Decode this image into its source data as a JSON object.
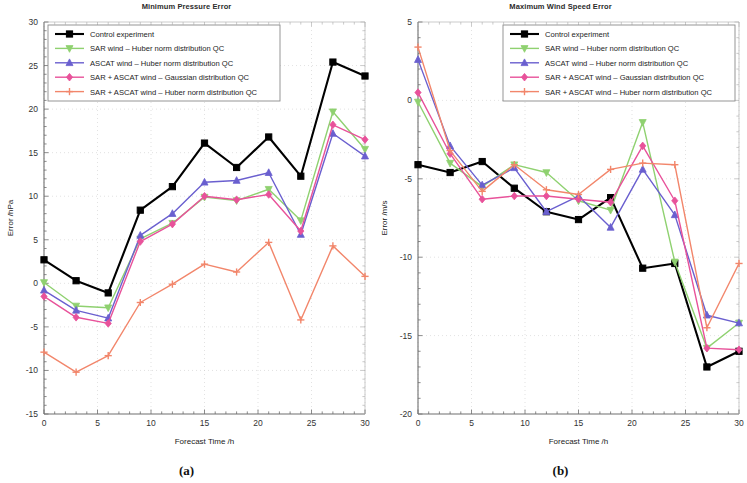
{
  "figure": {
    "panels": [
      {
        "caption": "(a)",
        "title": "Minimum Pressure Error",
        "xlabel": "Forecast Time /h",
        "ylabel": "Error /hPa"
      },
      {
        "caption": "(b)",
        "title": "Maximum Wind Speed Error",
        "xlabel": "Forecast Time /h",
        "ylabel": "Error /m/s"
      }
    ]
  },
  "series_style": {
    "control": {
      "color": "#000000",
      "marker": "square",
      "label": "Control experiment"
    },
    "sar": {
      "color": "#8fd170",
      "marker": "triangle-down",
      "label": "SAR wind – Huber norm distribution QC"
    },
    "ascat": {
      "color": "#6a5fcf",
      "marker": "triangle-up",
      "label": "ASCAT wind – Huber norm distribution QC"
    },
    "sar_ascat_gauss": {
      "color": "#e8529a",
      "marker": "diamond",
      "label": "SAR + ASCAT wind – Gaussian distribution QC"
    },
    "sar_ascat_huber": {
      "color": "#f2866b",
      "marker": "plus",
      "label": "SAR + ASCAT wind – Huber norm distribution QC"
    }
  },
  "chart_data": [
    {
      "type": "line",
      "title": "Minimum Pressure Error",
      "xlabel": "Forecast Time /h",
      "ylabel": "Error /hPa",
      "xlim": [
        0,
        30
      ],
      "ylim": [
        -15,
        30
      ],
      "xticks": [
        0,
        5,
        10,
        15,
        20,
        25,
        30
      ],
      "yticks": [
        -15,
        -10,
        -5,
        0,
        5,
        10,
        15,
        20,
        25,
        30
      ],
      "grid": true,
      "legend_position": "upper left",
      "x": [
        0,
        3,
        6,
        9,
        12,
        15,
        18,
        21,
        24,
        27,
        30
      ],
      "series": [
        {
          "name": "Control experiment",
          "values": [
            2.7,
            0.3,
            -1.1,
            8.4,
            11.1,
            16.1,
            13.3,
            16.8,
            12.3,
            25.4,
            23.8
          ]
        },
        {
          "name": "SAR wind – Huber norm distribution QC",
          "values": [
            0.1,
            -2.6,
            -2.8,
            5.1,
            6.9,
            9.9,
            9.5,
            10.8,
            7.2,
            19.7,
            15.4
          ]
        },
        {
          "name": "ASCAT wind – Huber norm distribution QC",
          "values": [
            -0.8,
            -3.1,
            -4.0,
            5.5,
            8.0,
            11.6,
            11.8,
            12.7,
            5.6,
            17.2,
            14.6
          ]
        },
        {
          "name": "SAR + ASCAT wind – Gaussian distribution QC",
          "values": [
            -1.5,
            -3.9,
            -4.6,
            4.8,
            6.8,
            10.0,
            9.6,
            10.2,
            6.0,
            18.2,
            16.5
          ]
        },
        {
          "name": "SAR + ASCAT wind – Huber norm distribution QC",
          "values": [
            -7.9,
            -10.2,
            -8.3,
            -2.2,
            -0.1,
            2.2,
            1.3,
            4.7,
            -4.2,
            4.3,
            0.8
          ]
        }
      ]
    },
    {
      "type": "line",
      "title": "Maximum Wind Speed Error",
      "xlabel": "Forecast Time /h",
      "ylabel": "Error /m/s",
      "xlim": [
        0,
        30
      ],
      "ylim": [
        -20,
        5
      ],
      "xticks": [
        0,
        5,
        10,
        15,
        20,
        25,
        30
      ],
      "yticks": [
        -20,
        -15,
        -10,
        -5,
        0,
        5
      ],
      "grid": true,
      "legend_position": "upper right",
      "x": [
        0,
        3,
        6,
        9,
        12,
        15,
        18,
        21,
        24,
        27,
        30
      ],
      "series": [
        {
          "name": "Control experiment",
          "values": [
            -4.1,
            -4.6,
            -3.9,
            -5.6,
            -7.1,
            -7.6,
            -6.2,
            -10.7,
            -10.4,
            -17.0,
            -16.0
          ]
        },
        {
          "name": "SAR wind – Huber norm distribution QC",
          "values": [
            -0.1,
            -4.0,
            -5.5,
            -4.1,
            -4.6,
            -6.4,
            -7.0,
            -1.4,
            -10.3,
            -15.8,
            -14.2
          ]
        },
        {
          "name": "ASCAT wind – Huber norm distribution QC",
          "values": [
            2.6,
            -2.9,
            -5.4,
            -4.3,
            -7.1,
            -6.1,
            -8.1,
            -4.4,
            -7.3,
            -13.7,
            -14.2
          ]
        },
        {
          "name": "SAR + ASCAT wind – Gaussian distribution QC",
          "values": [
            0.5,
            -3.4,
            -6.3,
            -6.1,
            -6.1,
            -6.3,
            -6.5,
            -2.9,
            -6.4,
            -15.8,
            -15.9
          ]
        },
        {
          "name": "SAR + ASCAT wind – Huber norm distribution QC",
          "values": [
            3.4,
            -3.2,
            -5.8,
            -4.1,
            -5.7,
            -6.0,
            -4.4,
            -4.0,
            -4.1,
            -14.5,
            -10.4
          ]
        }
      ]
    }
  ]
}
